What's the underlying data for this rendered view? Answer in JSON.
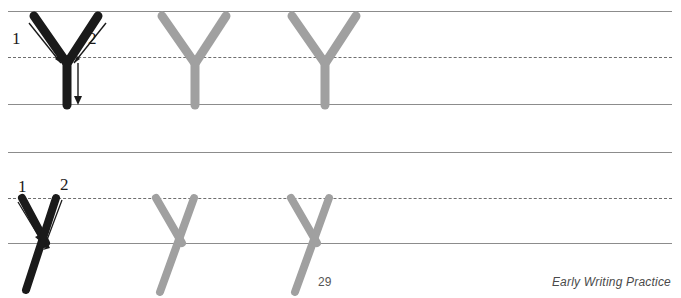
{
  "worksheet": {
    "letter_upper": "Y",
    "letter_lower": "y",
    "title_fragment": "Trace and Write",
    "colors": {
      "model_stroke": "#1a1a1a",
      "practice_stroke": "#a0a0a0",
      "rule_solid": "#8c8c8c",
      "rule_dashed": "#6e6e6e",
      "page_text": "#555555"
    }
  },
  "rows": [
    {
      "name": "uppercase-row",
      "letter": "Y",
      "case": "uppercase",
      "lines": {
        "top": 11,
        "midline": 57,
        "baseline": 104
      },
      "stroke_numbers": [
        "1",
        "2"
      ],
      "model_letter": "Y",
      "practice_letters": [
        "Y",
        "Y"
      ]
    },
    {
      "name": "lowercase-row",
      "letter": "y",
      "case": "lowercase",
      "lines": {
        "top": 152,
        "midline": 198,
        "baseline": 243
      },
      "stroke_numbers": [
        "1",
        "2"
      ],
      "model_letter": "y",
      "practice_letters": [
        "y",
        "y"
      ]
    }
  ],
  "footer": {
    "page_number": "29",
    "label": "Early Writing Practice"
  }
}
